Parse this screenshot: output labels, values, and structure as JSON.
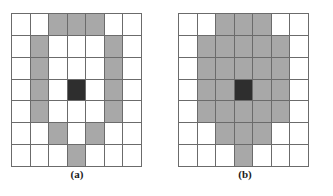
{
  "figure": {
    "background_color": "#ffffff",
    "grid_line_color": "#6b6b6b",
    "empty_cell_color": "#ffffff",
    "gray_cell_color": "#a8a8a8",
    "dark_cell_color": "#2e2e2e",
    "rows": 7,
    "columns": 7,
    "panels": [
      {
        "id": "a",
        "caption": "(a)",
        "description": "7 by 7 grid with ring of shaded cells around a dark center cell",
        "cells": [
          [
            "empty",
            "empty",
            "gray",
            "gray",
            "gray",
            "empty",
            "empty"
          ],
          [
            "empty",
            "gray",
            "empty",
            "empty",
            "empty",
            "gray",
            "empty"
          ],
          [
            "empty",
            "gray",
            "empty",
            "empty",
            "empty",
            "gray",
            "empty"
          ],
          [
            "empty",
            "gray",
            "empty",
            "dark",
            "empty",
            "gray",
            "empty"
          ],
          [
            "empty",
            "gray",
            "empty",
            "empty",
            "empty",
            "gray",
            "empty"
          ],
          [
            "empty",
            "empty",
            "gray",
            "empty",
            "gray",
            "empty",
            "empty"
          ],
          [
            "empty",
            "empty",
            "empty",
            "gray",
            "empty",
            "empty",
            "empty"
          ]
        ]
      },
      {
        "id": "b",
        "caption": "(b)",
        "description": "7 by 7 grid with filled disk of shaded cells around a dark center cell",
        "cells": [
          [
            "empty",
            "empty",
            "gray",
            "gray",
            "gray",
            "empty",
            "empty"
          ],
          [
            "empty",
            "gray",
            "gray",
            "gray",
            "gray",
            "gray",
            "empty"
          ],
          [
            "empty",
            "gray",
            "gray",
            "gray",
            "gray",
            "gray",
            "empty"
          ],
          [
            "empty",
            "gray",
            "gray",
            "dark",
            "gray",
            "gray",
            "empty"
          ],
          [
            "empty",
            "gray",
            "gray",
            "gray",
            "gray",
            "gray",
            "empty"
          ],
          [
            "empty",
            "empty",
            "gray",
            "gray",
            "gray",
            "empty",
            "empty"
          ],
          [
            "empty",
            "empty",
            "empty",
            "gray",
            "empty",
            "empty",
            "empty"
          ]
        ]
      }
    ]
  }
}
